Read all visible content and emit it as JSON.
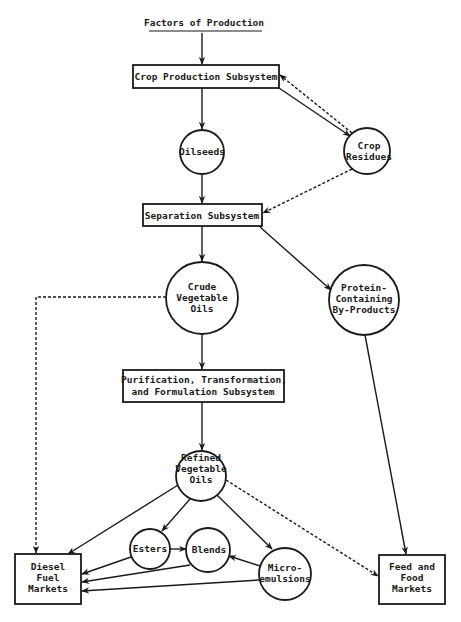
{
  "diagram": {
    "title": "Factors of Production",
    "nodes": {
      "crop_production": {
        "label": "Crop Production Subsystem",
        "shape": "rect"
      },
      "oilseeds": {
        "label": "Oilseeds",
        "shape": "circle"
      },
      "crop_residues": {
        "lines": [
          "Crop",
          "Residues"
        ],
        "shape": "circle"
      },
      "separation": {
        "label": "Separation Subsystem",
        "shape": "rect"
      },
      "crude_oils": {
        "lines": [
          "Crude",
          "Vegetable",
          "Oils"
        ],
        "shape": "circle"
      },
      "protein": {
        "lines": [
          "Protein-",
          "Containing",
          "By-Products"
        ],
        "shape": "circle"
      },
      "purification": {
        "lines": [
          "Purification, Transformation,",
          "and Formulation Subsystem"
        ],
        "shape": "rect"
      },
      "refined_oils": {
        "lines": [
          "Refined",
          "Vegetable",
          "Oils"
        ],
        "shape": "circle"
      },
      "esters": {
        "label": "Esters",
        "shape": "circle"
      },
      "blends": {
        "label": "Blends",
        "shape": "circle"
      },
      "microemulsions": {
        "lines": [
          "Micro-",
          "emulsions"
        ],
        "shape": "circle"
      },
      "diesel_markets": {
        "lines": [
          "Diesel",
          "Fuel",
          "Markets"
        ],
        "shape": "rect"
      },
      "feed_markets": {
        "lines": [
          "Feed and",
          "Food",
          "Markets"
        ],
        "shape": "rect"
      }
    },
    "edges": [
      {
        "from": "Factors of Production",
        "to": "Crop Production Subsystem",
        "style": "solid"
      },
      {
        "from": "Crop Production Subsystem",
        "to": "Oilseeds",
        "style": "solid"
      },
      {
        "from": "Crop Production Subsystem",
        "to": "Crop Residues",
        "style": "solid"
      },
      {
        "from": "Crop Residues",
        "to": "Crop Production Subsystem",
        "style": "dashed"
      },
      {
        "from": "Oilseeds",
        "to": "Separation Subsystem",
        "style": "solid"
      },
      {
        "from": "Crop Residues",
        "to": "Separation Subsystem",
        "style": "dashed"
      },
      {
        "from": "Separation Subsystem",
        "to": "Crude Vegetable Oils",
        "style": "solid"
      },
      {
        "from": "Separation Subsystem",
        "to": "Protein-Containing By-Products",
        "style": "solid"
      },
      {
        "from": "Crude Vegetable Oils",
        "to": "Diesel Fuel Markets",
        "style": "dashed"
      },
      {
        "from": "Crude Vegetable Oils",
        "to": "Purification, Transformation, and Formulation Subsystem",
        "style": "solid"
      },
      {
        "from": "Protein-Containing By-Products",
        "to": "Feed and Food Markets",
        "style": "solid"
      },
      {
        "from": "Purification, Transformation, and Formulation Subsystem",
        "to": "Refined Vegetable Oils",
        "style": "solid"
      },
      {
        "from": "Refined Vegetable Oils",
        "to": "Diesel Fuel Markets",
        "style": "solid"
      },
      {
        "from": "Refined Vegetable Oils",
        "to": "Esters",
        "style": "solid"
      },
      {
        "from": "Refined Vegetable Oils",
        "to": "Micro-emulsions",
        "style": "solid"
      },
      {
        "from": "Refined Vegetable Oils",
        "to": "Feed and Food Markets",
        "style": "dashed"
      },
      {
        "from": "Esters",
        "to": "Blends",
        "style": "solid"
      },
      {
        "from": "Micro-emulsions",
        "to": "Blends",
        "style": "solid"
      },
      {
        "from": "Esters",
        "to": "Diesel Fuel Markets",
        "style": "solid"
      },
      {
        "from": "Blends",
        "to": "Diesel Fuel Markets",
        "style": "solid"
      },
      {
        "from": "Micro-emulsions",
        "to": "Diesel Fuel Markets",
        "style": "solid"
      }
    ],
    "colors": {
      "ink": "#1a1a1a",
      "background": "#ffffff"
    }
  }
}
